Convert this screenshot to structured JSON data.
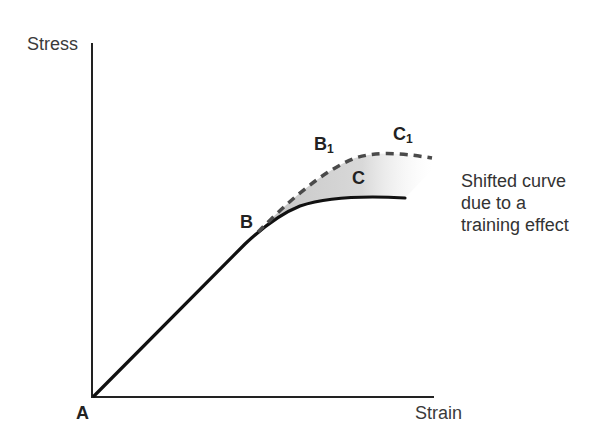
{
  "diagram": {
    "axes": {
      "y_label": "Stress",
      "x_label": "Strain"
    },
    "points": {
      "A": "A",
      "B": "B",
      "C": "C",
      "B1": "B",
      "B1_sub": "1",
      "C1": "C",
      "C1_sub": "1"
    },
    "annotation": {
      "lines": [
        "Shifted curve",
        "due to a",
        "training effect"
      ]
    },
    "curves": [
      {
        "name": "original stress-strain curve",
        "style": "solid",
        "path": [
          "A",
          "B",
          "C"
        ]
      },
      {
        "name": "shifted curve",
        "style": "dashed",
        "path": [
          "B",
          "B1",
          "C1"
        ]
      }
    ],
    "shaded_region": "area between original curve B-C and shifted curve B1-C1",
    "colors": {
      "line": "#111111",
      "dashed": "#555555",
      "shade": "#c8c8c8"
    }
  }
}
